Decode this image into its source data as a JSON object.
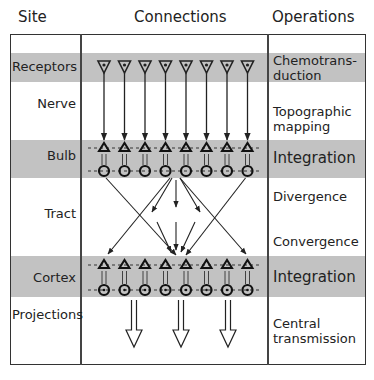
{
  "headers": {
    "site": "Site",
    "connections": "Connections",
    "operations": "Operations"
  },
  "rows": [
    {
      "site": "Receptors",
      "operation_line1": "Chemotrans-",
      "operation_line2": "duction",
      "shaded": true
    },
    {
      "site": "Nerve",
      "operation_line1": "Topographic",
      "operation_line2": "mapping",
      "shaded": false
    },
    {
      "site": "Bulb",
      "operation": "Integration",
      "shaded": true
    },
    {
      "site": "Tract",
      "operation_a": "Divergence",
      "operation_b": "Convergence",
      "shaded": false
    },
    {
      "site": "Cortex",
      "operation": "Integration",
      "shaded": true
    },
    {
      "site": "Projections",
      "operation_line1": "Central",
      "operation_line2": "transmission",
      "shaded": false
    }
  ],
  "colors": {
    "band": "#c2c2c2",
    "line": "#333333",
    "background": "#ffffff"
  },
  "diagram": {
    "receptor_count": 8,
    "bulb_cells": 8,
    "cortex_cells": 8,
    "projection_arrows": 3
  }
}
